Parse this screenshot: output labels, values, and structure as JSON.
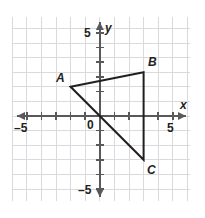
{
  "chart_data": {
    "type": "scatter",
    "title": "",
    "xlabel": "x",
    "ylabel": "y",
    "xlim": [
      -6,
      6
    ],
    "ylim": [
      -6,
      6
    ],
    "grid": true,
    "grid_step": 1,
    "legend": "none",
    "x_ticks": [
      -5,
      5
    ],
    "y_ticks": [
      5,
      -5
    ],
    "x_tick_labels": [
      "–5",
      "5"
    ],
    "y_tick_labels": [
      "5",
      "–5"
    ],
    "origin_label": "0",
    "shape": {
      "name": "triangle-ABC",
      "closed": true,
      "vertices": [
        {
          "label": "A",
          "x": -2,
          "y": 2
        },
        {
          "label": "B",
          "x": 3,
          "y": 3
        },
        {
          "label": "C",
          "x": 3,
          "y": -3
        }
      ]
    },
    "series": [
      {
        "name": "triangle ABC",
        "x": [
          -2,
          3,
          3,
          -2
        ],
        "y": [
          2,
          3,
          -3,
          2
        ]
      }
    ],
    "annotations": [
      {
        "text": "A",
        "x": -2,
        "y": 2
      },
      {
        "text": "B",
        "x": 3,
        "y": 3
      },
      {
        "text": "C",
        "x": 3,
        "y": -3
      }
    ]
  },
  "colors": {
    "background": "#ffffff",
    "grid": "#d9d9de",
    "axis": "#58595b",
    "shape_stroke": "#231f20",
    "text": "#231f20"
  },
  "labels": {
    "x_axis_name": "x",
    "y_axis_name": "y",
    "origin": "0",
    "x_neg5": "–5",
    "x_pos5": "5",
    "y_pos5": "5",
    "y_neg5": "–5",
    "vertex_a": "A",
    "vertex_b": "B",
    "vertex_c": "C"
  }
}
